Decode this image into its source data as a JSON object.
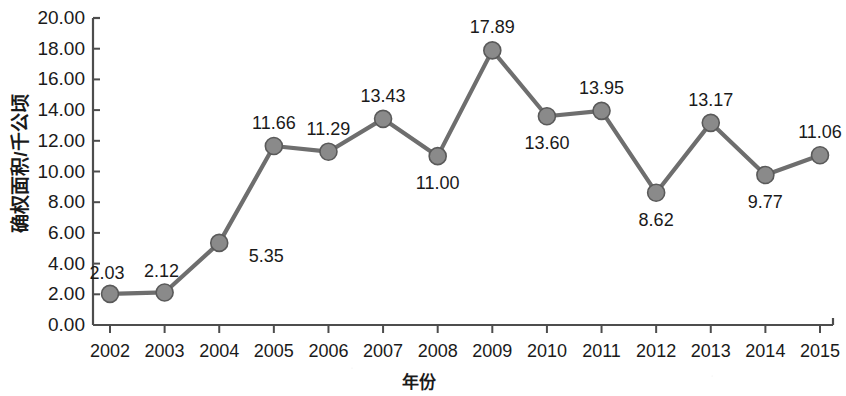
{
  "chart_data": {
    "type": "line",
    "title": "",
    "xlabel": "年份",
    "ylabel": "确权面积/千公顷",
    "categories": [
      "2002",
      "2003",
      "2004",
      "2005",
      "2006",
      "2007",
      "2008",
      "2009",
      "2010",
      "2011",
      "2012",
      "2013",
      "2014",
      "2015"
    ],
    "values": [
      2.03,
      2.12,
      5.35,
      11.66,
      11.29,
      13.43,
      11.0,
      17.89,
      13.6,
      13.95,
      8.62,
      13.17,
      9.77,
      11.06
    ],
    "point_labels": [
      "2.03",
      "2.12",
      "5.35",
      "11.66",
      "11.29",
      "13.43",
      "11.00",
      "17.89",
      "13.60",
      "13.95",
      "8.62",
      "13.17",
      "9.77",
      "11.06"
    ],
    "label_positions": [
      "left",
      "left",
      "right",
      "above",
      "above",
      "above",
      "below",
      "above",
      "below",
      "above",
      "below",
      "above",
      "below",
      "above"
    ],
    "ylim": [
      0,
      20
    ],
    "ytick_labels": [
      "0.00",
      "2.00",
      "4.00",
      "6.00",
      "8.00",
      "10.00",
      "12.00",
      "14.00",
      "16.00",
      "18.00",
      "20.00"
    ],
    "ytick_values": [
      0,
      2,
      4,
      6,
      8,
      10,
      12,
      14,
      16,
      18,
      20
    ],
    "grid": false,
    "legend": "none",
    "series_color": "#6e6e6e",
    "marker_color": "#8a8a8a",
    "marker_edge_color": "#5a5a5a",
    "axis_color": "#4d4d4d"
  }
}
